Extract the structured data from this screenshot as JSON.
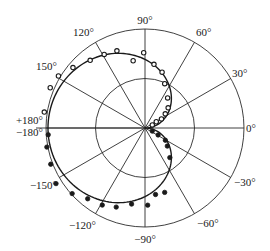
{
  "chart_data": {
    "type": "scatter",
    "subtype": "polar",
    "title": "",
    "radial_range": [
      0,
      1.0
    ],
    "radial_rings": [
      0.5,
      1.0
    ],
    "angle_unit": "deg",
    "spoke_angles": [
      0,
      30,
      60,
      90,
      120,
      150,
      180,
      -30,
      -60,
      -90,
      -120,
      -150
    ],
    "angle_tick_labels": [
      {
        "angle": 0,
        "text": "0°"
      },
      {
        "angle": 30,
        "text": "30°"
      },
      {
        "angle": 60,
        "text": "60°"
      },
      {
        "angle": 90,
        "text": "90°"
      },
      {
        "angle": 120,
        "text": "120°"
      },
      {
        "angle": 150,
        "text": "150°"
      },
      {
        "angle": 180,
        "text": "+180°"
      },
      {
        "angle": -180,
        "text": "−180°"
      },
      {
        "angle": -30,
        "text": "−30°"
      },
      {
        "angle": -60,
        "text": "−60°"
      },
      {
        "angle": -90,
        "text": "−90°"
      },
      {
        "angle": -120,
        "text": "−120°"
      },
      {
        "angle": -150,
        "text": "−150°"
      }
    ],
    "grid": true,
    "legend": "none",
    "series": [
      {
        "name": "theory-curve",
        "kind": "line",
        "formula": "r = 0.98 * sin(|theta|/2)",
        "theta_range": [
          -180,
          180
        ]
      },
      {
        "name": "measured-positive",
        "kind": "open-circles",
        "points": [
          {
            "theta": 171,
            "r": 1.03
          },
          {
            "theta": 157,
            "r": 1.04
          },
          {
            "theta": 149,
            "r": 1.02
          },
          {
            "theta": 140,
            "r": 0.95
          },
          {
            "theta": 129,
            "r": 0.88
          },
          {
            "theta": 119,
            "r": 0.85
          },
          {
            "theta": 110,
            "r": 0.83
          },
          {
            "theta": 100,
            "r": 0.69
          },
          {
            "theta": 91,
            "r": 0.76
          },
          {
            "theta": 82,
            "r": 0.65
          },
          {
            "theta": 73,
            "r": 0.59
          },
          {
            "theta": 66,
            "r": 0.49
          },
          {
            "theta": 53,
            "r": 0.38
          },
          {
            "theta": 41,
            "r": 0.31
          },
          {
            "theta": 35,
            "r": 0.25
          },
          {
            "theta": 29,
            "r": 0.19
          },
          {
            "theta": 29,
            "r": 0.13
          },
          {
            "theta": 23,
            "r": 0.08
          }
        ]
      },
      {
        "name": "measured-negative",
        "kind": "filled-circles",
        "points": [
          {
            "theta": -176,
            "r": 0.98
          },
          {
            "theta": -169,
            "r": 1.01
          },
          {
            "theta": -159,
            "r": 1.02
          },
          {
            "theta": -148,
            "r": 1.06
          },
          {
            "theta": -138,
            "r": 0.99
          },
          {
            "theta": -129,
            "r": 0.92
          },
          {
            "theta": -119,
            "r": 0.89
          },
          {
            "theta": -110,
            "r": 0.85
          },
          {
            "theta": -100,
            "r": 0.78
          },
          {
            "theta": -88,
            "r": 0.78
          },
          {
            "theta": -81,
            "r": 0.68
          },
          {
            "theta": -73,
            "r": 0.68
          },
          {
            "theta": -50,
            "r": 0.39
          },
          {
            "theta": -39,
            "r": 0.29
          },
          {
            "theta": -31,
            "r": 0.24
          },
          {
            "theta": -28,
            "r": 0.15
          },
          {
            "theta": -23,
            "r": 0.08
          }
        ]
      }
    ]
  }
}
